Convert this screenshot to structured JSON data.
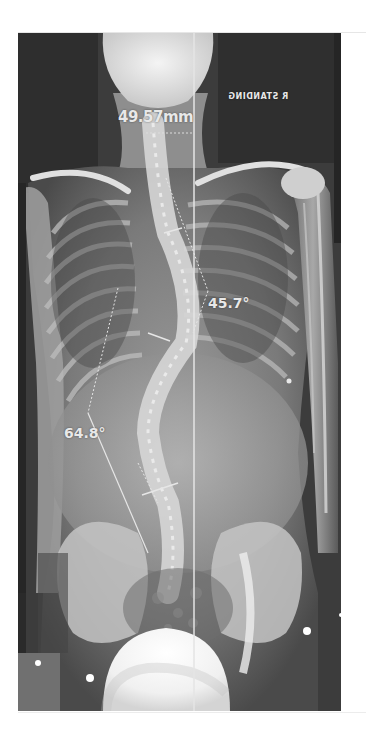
{
  "image": {
    "type": "radiograph",
    "subject": "full spine AP standing x-ray",
    "background": "#ffffff",
    "film_tone": "#3a3a3a"
  },
  "annotations": {
    "orientation_marker": "R STANDING",
    "orientation_marker_rendered": "ƎИIDИATS Я",
    "measurement_distance": "49.57mm",
    "cobb_angle_thoracic": "45.7°",
    "cobb_angle_lumbar": "64.8°"
  },
  "markers": {
    "plumb_line": "vertical reference line",
    "bright_dots": 4
  }
}
